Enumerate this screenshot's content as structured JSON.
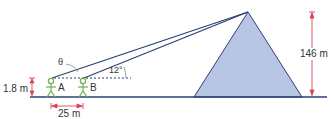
{
  "diagram": {
    "labels": {
      "height_person": "1.8 m",
      "distance_ab": "25 m",
      "height_pyramid": "146 m",
      "angle_b": "12°",
      "angle_a": "θ",
      "point_a": "A",
      "point_b": "B"
    },
    "colors": {
      "line": "#2b3f73",
      "pyramid_fill": "#b8c6e3",
      "person": "#6ab04c",
      "arrow": "#d9455f"
    }
  }
}
